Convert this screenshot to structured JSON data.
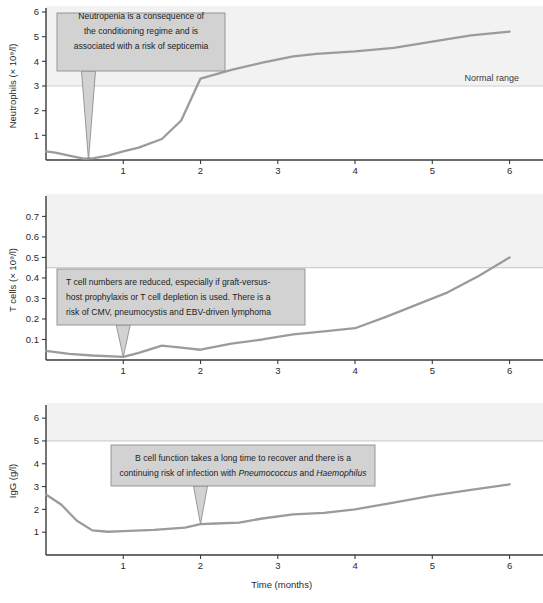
{
  "figure": {
    "xaxis_caption": "Time (months)",
    "normal_range_label": "Normal range"
  },
  "chart_data": [
    {
      "type": "line",
      "id": "neutrophils",
      "title": "",
      "ylabel": "Neutrophils (× 10⁹/l)",
      "xlabel": "Time (months)",
      "xlim": [
        0,
        6.2
      ],
      "ylim": [
        0,
        6
      ],
      "xticks": [
        1,
        2,
        3,
        4,
        5,
        6
      ],
      "yticks": [
        1,
        2,
        3,
        4,
        5,
        6
      ],
      "grid": false,
      "normal_range_threshold": 3,
      "normal_range_label": "Normal range",
      "annotation": "Neutropenia is a consequence of the conditioning regime and is associated with a risk of septicemia",
      "annotation_lines": [
        "Neutropenia is a consequence of",
        "the conditioning regime and is",
        "associated with a risk of septicemia"
      ],
      "annotation_target_x": 0.55,
      "x": [
        0.0,
        0.12,
        0.3,
        0.5,
        0.62,
        0.8,
        1.0,
        1.2,
        1.5,
        1.75,
        2.0,
        2.4,
        2.8,
        3.2,
        3.5,
        4.0,
        4.5,
        5.0,
        5.5,
        6.0
      ],
      "values": [
        0.35,
        0.3,
        0.18,
        0.05,
        0.08,
        0.18,
        0.35,
        0.5,
        0.85,
        1.6,
        3.3,
        3.65,
        3.95,
        4.2,
        4.3,
        4.4,
        4.55,
        4.8,
        5.05,
        5.2
      ]
    },
    {
      "type": "line",
      "id": "tcells",
      "title": "",
      "ylabel": "T cells (× 10⁹/l)",
      "xlabel": "Time (months)",
      "xlim": [
        0,
        6.2
      ],
      "ylim": [
        0,
        0.78
      ],
      "xticks": [
        1,
        2,
        3,
        4,
        5,
        6
      ],
      "yticks": [
        0.1,
        0.2,
        0.3,
        0.4,
        0.5,
        0.6,
        0.7
      ],
      "grid": false,
      "normal_range_threshold": 0.45,
      "annotation": "T cell numbers are reduced, especially if graft-versus-host prophylaxis or T cell depletion is used. There is a risk of CMV, pneumocystis and EBV-driven lymphoma",
      "annotation_lines": [
        "T cell numbers are reduced, especially if graft-versus-",
        "host prophylaxis or T cell depletion is used. There is a",
        "risk of CMV, pneumocystis and EBV-driven lymphoma"
      ],
      "annotation_target_x": 1.0,
      "x": [
        0.0,
        0.3,
        0.6,
        1.0,
        1.2,
        1.5,
        1.75,
        2.0,
        2.4,
        2.8,
        3.2,
        3.6,
        4.0,
        4.4,
        4.8,
        5.2,
        5.6,
        6.0
      ],
      "values": [
        0.045,
        0.03,
        0.022,
        0.015,
        0.035,
        0.07,
        0.06,
        0.05,
        0.08,
        0.1,
        0.125,
        0.14,
        0.155,
        0.21,
        0.27,
        0.33,
        0.41,
        0.5
      ]
    },
    {
      "type": "line",
      "id": "igg",
      "title": "",
      "ylabel": "IgG (g/l)",
      "xlabel": "Time (months)",
      "xlim": [
        0,
        6.2
      ],
      "ylim": [
        0,
        6.4
      ],
      "xticks": [
        1,
        2,
        3,
        4,
        5,
        6
      ],
      "yticks": [
        1,
        2,
        3,
        4,
        5,
        6
      ],
      "grid": false,
      "normal_range_threshold": 5,
      "annotation": "B cell function takes a long time to recover and there is a continuing risk of infection with Pneumococcus and Haemophilus",
      "annotation_lines": [
        "B cell function takes a long time to recover and there is a",
        "continuing risk of infection with Pneumococcus and Haemophilus"
      ],
      "annotation_italic_terms": [
        "Pneumococcus",
        "Haemophilus"
      ],
      "annotation_target_x": 2.0,
      "x": [
        0.0,
        0.2,
        0.4,
        0.6,
        0.8,
        1.0,
        1.4,
        1.8,
        2.0,
        2.2,
        2.5,
        2.8,
        3.2,
        3.6,
        4.0,
        4.5,
        5.0,
        5.5,
        6.0
      ],
      "values": [
        2.65,
        2.2,
        1.5,
        1.08,
        1.02,
        1.05,
        1.1,
        1.2,
        1.35,
        1.38,
        1.42,
        1.6,
        1.78,
        1.85,
        2.0,
        2.3,
        2.6,
        2.85,
        3.1
      ]
    }
  ]
}
